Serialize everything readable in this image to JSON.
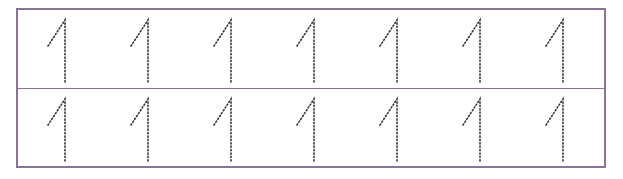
{
  "worksheet": {
    "title": "",
    "border_color": "#8a7396",
    "dot_color": "#333333",
    "rows": [
      {
        "name": "row-1",
        "digits": [
          "1",
          "1",
          "1",
          "1",
          "1",
          "1",
          "1"
        ]
      },
      {
        "name": "row-2",
        "digits": [
          "1",
          "1",
          "1",
          "1",
          "1",
          "1",
          "1"
        ]
      }
    ]
  }
}
